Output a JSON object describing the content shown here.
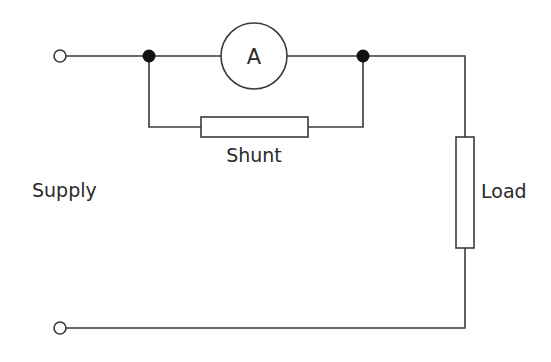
{
  "diagram": {
    "type": "circuit",
    "title": "",
    "labels": {
      "ammeter": "A",
      "shunt": "Shunt",
      "supply": "Supply",
      "load": "Load"
    },
    "components": [
      {
        "id": "terminal-top",
        "kind": "terminal",
        "label": ""
      },
      {
        "id": "terminal-bottom",
        "kind": "terminal",
        "label": ""
      },
      {
        "id": "junction-left",
        "kind": "junction"
      },
      {
        "id": "junction-right",
        "kind": "junction"
      },
      {
        "id": "ammeter",
        "kind": "meter",
        "label": "A"
      },
      {
        "id": "shunt",
        "kind": "resistor",
        "label": "Shunt"
      },
      {
        "id": "load",
        "kind": "resistor",
        "label": "Load"
      }
    ],
    "colors": {
      "line": "#3a3a3a",
      "junction": "#111111",
      "background": "#ffffff"
    }
  }
}
